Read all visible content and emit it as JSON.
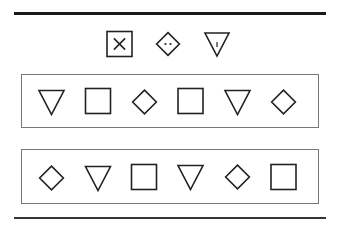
{
  "diagram": {
    "colors": {
      "stroke": "#222222",
      "panel_border": "#777777",
      "rule": "#1a1a1a",
      "background": "#ffffff"
    },
    "legend": [
      {
        "shape": "square",
        "marking": "x-cross",
        "x": 119.5,
        "y": 44,
        "size": 25
      },
      {
        "shape": "diamond",
        "marking": "two-dots",
        "x": 168,
        "y": 44,
        "size": 24
      },
      {
        "shape": "triangle-down",
        "marking": "vertical-tick",
        "x": 217,
        "y": 44,
        "size": 24
      }
    ],
    "rows": [
      {
        "label": "row-1",
        "shapes": [
          {
            "shape": "triangle-down",
            "x": 51.5,
            "y": 102
          },
          {
            "shape": "square",
            "x": 98,
            "y": 101
          },
          {
            "shape": "diamond",
            "x": 144.5,
            "y": 102
          },
          {
            "shape": "square",
            "x": 190.5,
            "y": 101
          },
          {
            "shape": "triangle-down",
            "x": 237.5,
            "y": 102
          },
          {
            "shape": "diamond",
            "x": 283.5,
            "y": 102
          }
        ]
      },
      {
        "label": "row-2",
        "shapes": [
          {
            "shape": "diamond",
            "x": 51.5,
            "y": 178
          },
          {
            "shape": "triangle-down",
            "x": 98,
            "y": 178
          },
          {
            "shape": "square",
            "x": 144,
            "y": 177
          },
          {
            "shape": "triangle-down",
            "x": 190.5,
            "y": 177
          },
          {
            "shape": "diamond",
            "x": 237.5,
            "y": 177
          },
          {
            "shape": "square",
            "x": 283.5,
            "y": 177
          }
        ]
      }
    ]
  }
}
